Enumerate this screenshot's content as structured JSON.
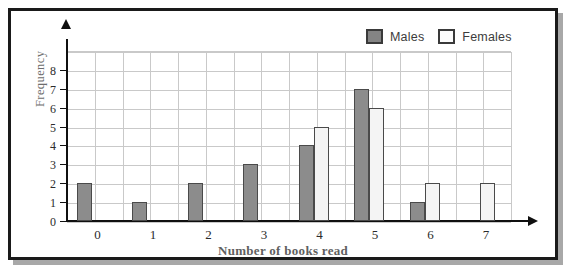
{
  "chart_data": {
    "type": "bar",
    "title": "",
    "xlabel": "Number of books read",
    "ylabel": "Frequency",
    "categories": [
      "0",
      "1",
      "2",
      "3",
      "4",
      "5",
      "6",
      "7"
    ],
    "series": [
      {
        "name": "Males",
        "color": "#8c8c8c",
        "values": [
          2,
          1,
          2,
          3,
          4,
          7,
          1,
          0
        ]
      },
      {
        "name": "Females",
        "color": "#f4f4f4",
        "values": [
          0,
          0,
          0,
          0,
          5,
          6,
          2,
          2
        ]
      }
    ],
    "ylim": [
      0,
      9
    ],
    "ytick_labels": [
      "0",
      "1",
      "2",
      "3",
      "4",
      "5",
      "6",
      "7",
      "8"
    ],
    "grid": true,
    "legend_position": "top-right"
  },
  "legend": {
    "entries": [
      {
        "label": "Males",
        "swatch": "males-swatch"
      },
      {
        "label": "Females",
        "swatch": "females-swatch"
      }
    ]
  },
  "axes": {
    "y_title": "Frequency",
    "x_title": "Number of books read"
  },
  "colors": {
    "males": "#8c8c8c",
    "females": "#f4f4f4",
    "bar_border": "#4a4a4a",
    "grid": "#c9c9c9",
    "axis": "#101010",
    "frame": "#1a1a1a",
    "shadow": "#a8a8a8"
  }
}
